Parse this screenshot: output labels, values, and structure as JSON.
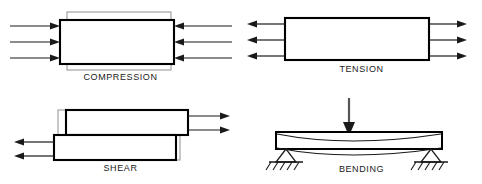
{
  "figure": {
    "background_color": "#ffffff",
    "outline_color": "#000000",
    "ghost_color": "#9a9a9a",
    "arrow_color": "#1a1a1a",
    "label_color": "#1a1a1a"
  },
  "panels": [
    {
      "id": "compression",
      "label": "COMPRESSION",
      "arrows_left": {
        "count": 3,
        "direction": "right",
        "points": "inward"
      },
      "arrows_right": {
        "count": 3,
        "direction": "left",
        "points": "inward"
      },
      "shape": "rectangle",
      "deformation": "shortened-horizontally",
      "original_outline": "gray-taller-wider-rectangle",
      "deformed_outline": "black-bold-rectangle"
    },
    {
      "id": "tension",
      "label": "TENSION",
      "arrows_left": {
        "count": 3,
        "direction": "left",
        "points": "outward"
      },
      "arrows_right": {
        "count": 3,
        "direction": "right",
        "points": "outward"
      },
      "shape": "rectangle",
      "deformation": "stretched-horizontally",
      "original_outline": "gray-shorter-rectangle",
      "deformed_outline": "black-bold-rectangle"
    },
    {
      "id": "shear",
      "label": "SHEAR",
      "arrows_top_right": {
        "count": 2,
        "direction": "right"
      },
      "arrows_bottom_left": {
        "count": 2,
        "direction": "left"
      },
      "shape": "two-stacked-offset-rectangles",
      "deformation": "sliding-opposite-directions",
      "original_outline": "gray-aligned-rectangles",
      "deformed_outline": "black-bold-offset-rectangles"
    },
    {
      "id": "bending",
      "label": "BENDING",
      "load_arrow": {
        "count": 1,
        "direction": "down",
        "position": "center-top"
      },
      "shape": "horizontal-beam",
      "deformation": "sagging-downward-curve",
      "supports": {
        "count": 2,
        "type": "hatched-triangle-ground",
        "positions": [
          "left",
          "right"
        ]
      }
    }
  ]
}
